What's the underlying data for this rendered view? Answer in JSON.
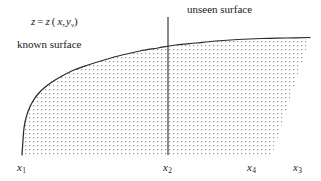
{
  "figure": {
    "equation": {
      "z_lhs": "z",
      "equals": "=",
      "z_rhs": "z",
      "open_paren": "(",
      "x_var": "x",
      "comma": ",",
      "y_var": "y",
      "y_subscript": "v",
      "close_paren": ")",
      "full_text": "z = z (x, y_v)"
    },
    "annotations": [
      {
        "id": "known-surface",
        "text": "known surface"
      },
      {
        "id": "unseen-surface",
        "text": "unseen surface"
      }
    ],
    "axis_labels": [
      {
        "id": "x1",
        "base": "x",
        "sub": "1"
      },
      {
        "id": "x2",
        "base": "x",
        "sub": "2"
      },
      {
        "id": "x4",
        "base": "x",
        "sub": "4"
      },
      {
        "id": "x3",
        "base": "x",
        "sub": "3"
      }
    ],
    "colors": {
      "curve": "#2b2b2b",
      "divider": "#3a3a3a",
      "stipple": "#8c8c8c",
      "text": "#1a1a1a",
      "background": "#ffffff"
    }
  },
  "chart_data": {
    "type": "area",
    "title": "",
    "xlabel": "",
    "ylabel": "",
    "xlim": [
      0,
      321
    ],
    "ylim": [
      181,
      0
    ],
    "grid": false,
    "legend": false,
    "curve_points": [
      [
        22,
        155
      ],
      [
        23,
        140
      ],
      [
        24,
        128
      ],
      [
        26,
        118
      ],
      [
        29,
        109
      ],
      [
        33,
        101
      ],
      [
        38,
        94
      ],
      [
        44,
        88
      ],
      [
        52,
        82
      ],
      [
        62,
        76
      ],
      [
        74,
        70
      ],
      [
        88,
        65
      ],
      [
        104,
        60
      ],
      [
        122,
        55
      ],
      [
        140,
        51
      ],
      [
        158,
        48
      ],
      [
        176,
        45
      ],
      [
        196,
        43
      ],
      [
        216,
        41
      ],
      [
        238,
        39.5
      ],
      [
        262,
        38.5
      ],
      [
        286,
        38
      ],
      [
        310,
        37.5
      ]
    ],
    "fill_baseline_y": 155,
    "fill_right_edge": [
      [
        310,
        37.5
      ],
      [
        272,
        155
      ]
    ],
    "divider_line": {
      "x": 168,
      "y_top": 17,
      "y_bottom": 155
    },
    "x_tick_positions": [
      {
        "label": "x1",
        "x": 22
      },
      {
        "label": "x2",
        "x": 168
      },
      {
        "label": "x4",
        "x": 252
      },
      {
        "label": "x3",
        "x": 298
      }
    ]
  }
}
